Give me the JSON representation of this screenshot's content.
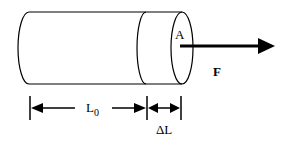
{
  "diagram": {
    "type": "cylinder-elongation",
    "labels": {
      "area": "A",
      "force": "F",
      "original_length": "L",
      "original_length_subscript": "0",
      "elongation": "ΔL"
    },
    "colors": {
      "stroke": "#000000",
      "background": "#ffffff"
    }
  }
}
